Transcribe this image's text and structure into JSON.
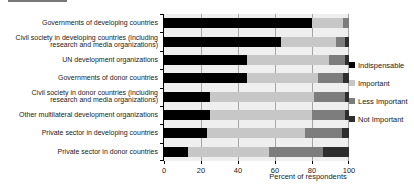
{
  "chart_data": {
    "type": "bar",
    "orientation": "horizontal",
    "stacked": true,
    "title": "",
    "xlabel": "Percent of respondents",
    "xlim": [
      0,
      100
    ],
    "xticks": [
      0,
      20,
      40,
      60,
      80,
      100
    ],
    "grid": "vertical",
    "legend_position": "right",
    "categories": [
      "Governments of developing countries",
      "Civil society in developing countries (including\nresearch and media organizations)",
      "UN development organizations",
      "Governments of donor countries",
      "Civil society in donor countries (including\nresearch and media organizations)",
      "Other multilateral development organizations",
      "Private sector in developing countries",
      "Private sector in donor countries"
    ],
    "series": [
      {
        "name": "Indispensable",
        "color": "#000000",
        "values": [
          80,
          63,
          45,
          45,
          25,
          25,
          23,
          13
        ]
      },
      {
        "name": "Important",
        "color": "#c7c7c7",
        "values": [
          17,
          30,
          44,
          38,
          56,
          55,
          53,
          44
        ]
      },
      {
        "name": "Less Important",
        "color": "#7d7d7d",
        "values": [
          3,
          5,
          9,
          14,
          17,
          18,
          20,
          29
        ]
      },
      {
        "name": "Not Important",
        "color": "#2e2e2e",
        "values": [
          0,
          2,
          2,
          3,
          2,
          2,
          4,
          14
        ]
      }
    ]
  },
  "colors": {
    "plot_background": "#efefef",
    "gridline": "#a6a6a6",
    "axis": "#000000"
  }
}
